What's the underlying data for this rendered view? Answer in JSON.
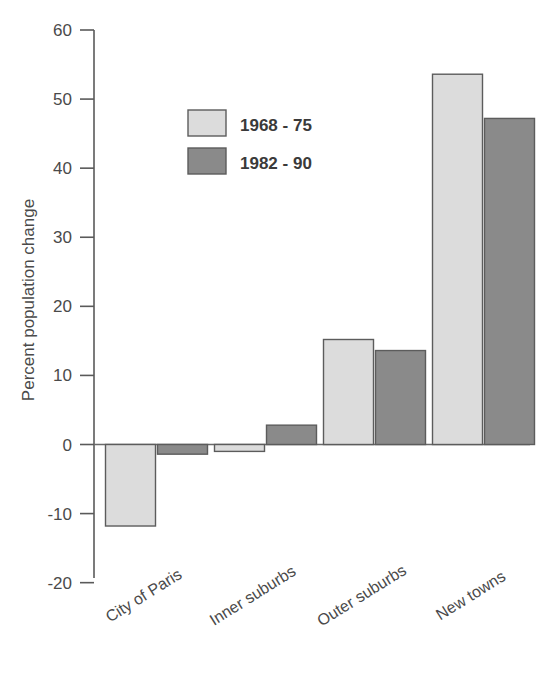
{
  "chart_data": {
    "type": "bar",
    "title": "",
    "xlabel": "",
    "ylabel": "Percent population change",
    "categories": [
      "City of Paris",
      "Inner suburbs",
      "Outer suburbs",
      "New towns"
    ],
    "series": [
      {
        "name": "1968 - 75",
        "color": "#dcdcdc",
        "values": [
          -11.8,
          -1.0,
          15.2,
          53.6
        ]
      },
      {
        "name": "1982 - 90",
        "color": "#8a8a8a",
        "values": [
          -1.4,
          2.8,
          13.6,
          47.2
        ]
      }
    ],
    "ylim": [
      -20,
      60
    ],
    "yticks": [
      -20,
      -10,
      0,
      10,
      20,
      30,
      40,
      50,
      60
    ],
    "ytick_labels": [
      "-20",
      "-10",
      "0",
      "10",
      "20",
      "30",
      "40",
      "50",
      "60"
    ],
    "grid": false,
    "legend_position": "upper left inside",
    "zero_line": true,
    "category_label_rotation": -32
  },
  "axis": {
    "y_title": "Percent population change"
  },
  "legend": {
    "entries": [
      {
        "label": "1968 - 75",
        "swatch": "light-gray-swatch"
      },
      {
        "label": "1982 - 90",
        "swatch": "dark-gray-swatch"
      }
    ]
  },
  "colors": {
    "series_1": "#dcdcdc",
    "series_2": "#8a8a8a",
    "axis": "#5a5a5a",
    "text": "#4a4a4a",
    "background": "#ffffff"
  }
}
